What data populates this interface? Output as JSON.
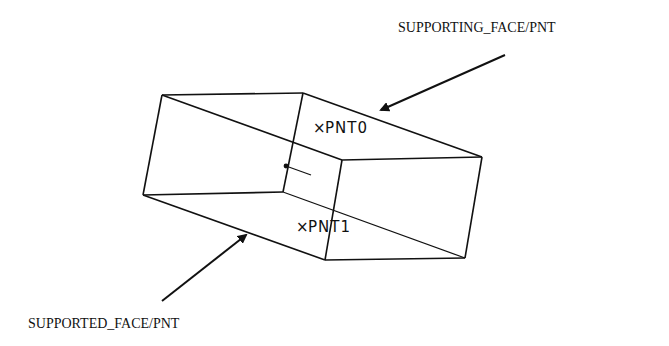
{
  "diagram": {
    "labels": {
      "supporting": "SUPPORTING_FACE/PNT",
      "supported": "SUPPORTED_FACE/PNT"
    },
    "points": [
      {
        "marker": "×",
        "name": "PNT0"
      },
      {
        "marker": "×",
        "name": "PNT1"
      }
    ],
    "colors": {
      "stroke": "#111111",
      "background": "#ffffff"
    }
  }
}
